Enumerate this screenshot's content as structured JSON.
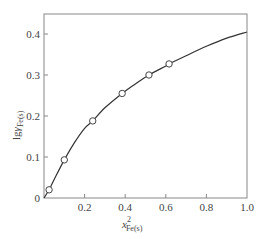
{
  "chart_data": {
    "type": "line",
    "title": "",
    "xlabel": "x²Fe(s)",
    "ylabel": "lgγFe(s)",
    "xlabel_parts": {
      "main": "x",
      "sup": "2",
      "sub": "Fe(s)"
    },
    "ylabel_parts": {
      "main": "lg",
      "greek": "γ",
      "sub": "Fe(s)"
    },
    "xlim": [
      0,
      1.0
    ],
    "ylim": [
      0,
      0.45
    ],
    "x_ticks": [
      0.2,
      0.4,
      0.6,
      0.8,
      1.0
    ],
    "x_tick_labels": [
      "0.2",
      "0.4",
      "0.6",
      "0.8",
      "1.0"
    ],
    "y_ticks": [
      0,
      0.1,
      0.2,
      0.3,
      0.4
    ],
    "y_tick_labels": [
      "0",
      "0.1",
      "0.2",
      "0.3",
      "0.4"
    ],
    "grid": false,
    "legend": null,
    "series": [
      {
        "name": "fitted curve",
        "style": "solid-line",
        "x": [
          0,
          0.025,
          0.05,
          0.1,
          0.15,
          0.2,
          0.24,
          0.3,
          0.385,
          0.45,
          0.517,
          0.6,
          0.616,
          0.7,
          0.8,
          0.9,
          1.0
        ],
        "values": [
          0,
          0.02,
          0.045,
          0.093,
          0.135,
          0.17,
          0.188,
          0.22,
          0.255,
          0.278,
          0.3,
          0.322,
          0.327,
          0.347,
          0.37,
          0.39,
          0.405
        ]
      },
      {
        "name": "measured points",
        "style": "open-circle-markers",
        "x": [
          0.025,
          0.1,
          0.24,
          0.385,
          0.517,
          0.616
        ],
        "values": [
          0.02,
          0.093,
          0.188,
          0.255,
          0.3,
          0.327
        ]
      }
    ]
  }
}
